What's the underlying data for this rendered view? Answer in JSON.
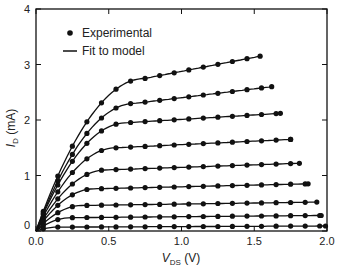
{
  "chart_data": {
    "type": "line",
    "title": "",
    "xlabel": "V_DS (V)",
    "ylabel": "I_D (mA)",
    "xlim": [
      0,
      2.0
    ],
    "ylim": [
      0,
      4
    ],
    "xticks": [
      "0.0",
      "0.5",
      "1.0",
      "1.5",
      "2.0"
    ],
    "yticks": [
      "0",
      "1",
      "2",
      "3",
      "4"
    ],
    "grid": false,
    "legend": {
      "position": "upper left",
      "entries": [
        {
          "marker": "dot",
          "label": "Experimental"
        },
        {
          "marker": "line",
          "label": "Fit to model"
        }
      ]
    },
    "series": [
      {
        "name": "curve1",
        "isat": 2.75,
        "vsat": 0.75,
        "slope": 0.52,
        "xmax": 1.54,
        "end": 3.15
      },
      {
        "name": "curve2",
        "isat": 2.3,
        "vsat": 0.68,
        "slope": 0.35,
        "xmax": 1.62,
        "end": 2.6
      },
      {
        "name": "curve3",
        "isat": 1.95,
        "vsat": 0.62,
        "slope": 0.18,
        "xmax": 1.68,
        "end": 2.12
      },
      {
        "name": "curve4",
        "isat": 1.5,
        "vsat": 0.55,
        "slope": 0.13,
        "xmax": 1.75,
        "end": 1.65
      },
      {
        "name": "curve5",
        "isat": 1.1,
        "vsat": 0.48,
        "slope": 0.09,
        "xmax": 1.81,
        "end": 1.22
      },
      {
        "name": "curve6",
        "isat": 0.76,
        "vsat": 0.4,
        "slope": 0.06,
        "xmax": 1.87,
        "end": 0.85
      },
      {
        "name": "curve7",
        "isat": 0.46,
        "vsat": 0.32,
        "slope": 0.04,
        "xmax": 1.93,
        "end": 0.52
      },
      {
        "name": "curve8",
        "isat": 0.24,
        "vsat": 0.24,
        "slope": 0.025,
        "xmax": 1.96,
        "end": 0.28
      },
      {
        "name": "curve9",
        "isat": 0.07,
        "vsat": 0.15,
        "slope": 0.01,
        "xmax": 1.99,
        "end": 0.09
      }
    ]
  }
}
